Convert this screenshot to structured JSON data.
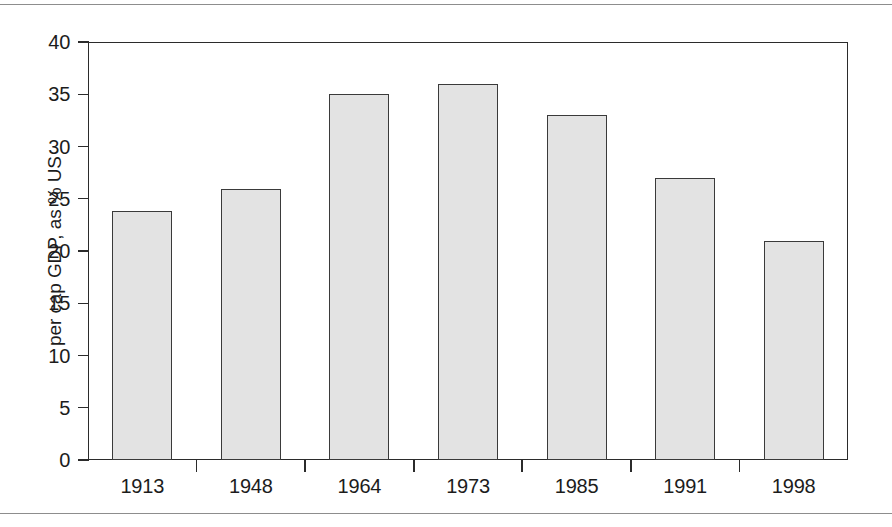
{
  "figure": {
    "background_color": "#ffffff",
    "frame_color": "#2b2b2b",
    "bar_fill_color": "#e3e3e3",
    "bar_edge_color": "#3a3a3a",
    "rule_color": "#8d8d8d"
  },
  "axes": {
    "ylabel": "per cap GDP, as % US",
    "yticks": [
      "0",
      "5",
      "10",
      "15",
      "20",
      "25",
      "30",
      "35",
      "40"
    ],
    "xticklabels": [
      "1913",
      "1948",
      "1964",
      "1973",
      "1985",
      "1991",
      "1998"
    ]
  },
  "chart_data": {
    "type": "bar",
    "title": "",
    "xlabel": "",
    "ylabel": "per cap GDP, as % US",
    "categories": [
      "1913",
      "1948",
      "1964",
      "1973",
      "1985",
      "1991",
      "1998"
    ],
    "values": [
      23.8,
      25.9,
      35.0,
      36.0,
      33.0,
      27.0,
      21.0
    ],
    "ylim": [
      0,
      40
    ],
    "ytick_step": 5,
    "grid": false,
    "legend": false,
    "legend_position": "none",
    "bar_fill": "#e3e3e3",
    "bar_edge": "#3a3a3a"
  }
}
